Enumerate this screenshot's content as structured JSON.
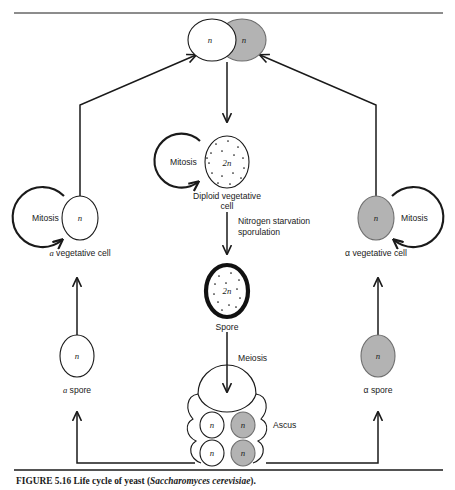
{
  "figure": {
    "title_id": "FIGURE 5.16",
    "caption_lead": "Life cycle of yeast (",
    "caption_species": "Saccharomyces cerevisiae",
    "caption_tail": ")."
  },
  "nodes": {
    "zygote": {
      "name": "zygote",
      "left_label": "n",
      "right_label": "n"
    },
    "diploid_vegetative_cell": {
      "ploidy_label": "2n",
      "caption_line1": "Diploid vegetative",
      "caption_line2": "cell"
    },
    "spore": {
      "ploidy_label": "2n",
      "caption": "Spore"
    },
    "ascus": {
      "caption": "Ascus",
      "spores": [
        {
          "label": "n",
          "type": "a"
        },
        {
          "label": "n",
          "type": "alpha"
        },
        {
          "label": "n",
          "type": "a"
        },
        {
          "label": "n",
          "type": "alpha"
        }
      ]
    },
    "a_vegetative_cell": {
      "ploidy_label": "n",
      "mating_type": "a",
      "caption_rest": " vegetative cell"
    },
    "alpha_vegetative_cell": {
      "ploidy_label": "n",
      "mating_type": "α",
      "caption_rest": " vegetative cell"
    },
    "a_spore": {
      "ploidy_label": "n",
      "mating_type": "a",
      "caption_rest": " spore"
    },
    "alpha_spore": {
      "ploidy_label": "n",
      "mating_type": "α",
      "caption_rest": " spore"
    }
  },
  "process_labels": {
    "mitosis_left": "Mitosis",
    "mitosis_center": "Mitosis",
    "mitosis_right": "Mitosis",
    "nitrogen_line1": "Nitrogen starvation",
    "nitrogen_line2": "sporulation",
    "meiosis": "Meiosis"
  },
  "colors": {
    "ink": "#1a1a1a",
    "gray_cell_fill": "#b3b3b3",
    "gray_cell_stroke": "#6e6e6e",
    "white_cell_fill": "#ffffff",
    "page_background": "#ffffff"
  }
}
